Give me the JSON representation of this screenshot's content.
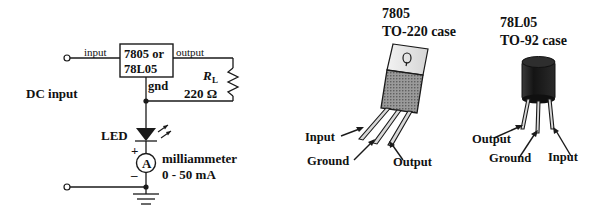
{
  "figure": {
    "type": "circuit-schematic-and-package-diagram",
    "title": "",
    "background_color": "#ffffff",
    "ink_color": "#111111"
  },
  "circuit": {
    "name": "voltage-regulator-test-circuit",
    "source_label": "DC input",
    "ic": {
      "line1": "7805 or",
      "line2": "78L05",
      "pin_input": "input",
      "pin_output": "output",
      "pin_ground": "gnd"
    },
    "load": {
      "symbol": "R",
      "subscript": "L",
      "value": "220 Ω"
    },
    "led_label": "LED",
    "meter": {
      "symbol": "A",
      "plus": "+",
      "minus": "–",
      "label_line1": "milliammeter",
      "label_line2": "0 - 50 mA"
    }
  },
  "packages": [
    {
      "id": "to220",
      "part_number": "7805",
      "case_label": "TO-220 case",
      "case_color": "#8a8a8a",
      "tab_color": "#e8e8e8",
      "pins": [
        {
          "name": "Input"
        },
        {
          "name": "Ground"
        },
        {
          "name": "Output"
        }
      ]
    },
    {
      "id": "to92",
      "part_number": "78L05",
      "case_label": "TO-92 case",
      "case_color": "#1a1a1a",
      "pins": [
        {
          "name": "Output"
        },
        {
          "name": "Ground"
        },
        {
          "name": "Input"
        }
      ]
    }
  ]
}
